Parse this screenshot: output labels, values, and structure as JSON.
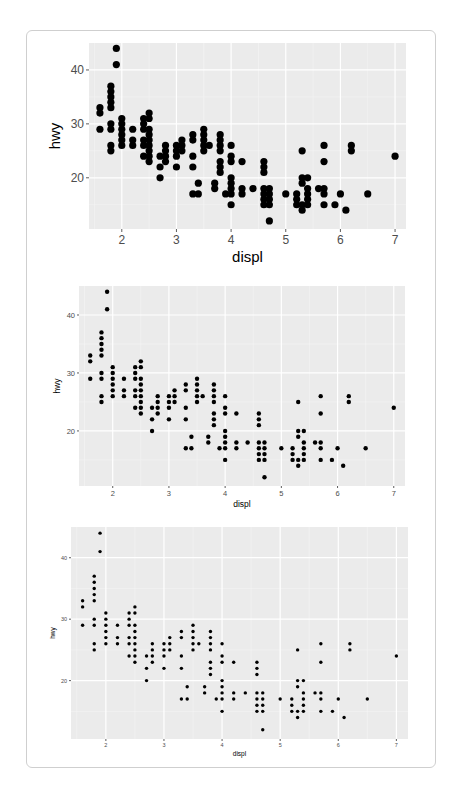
{
  "page": {
    "header_text": "Data Visu"
  },
  "chart_data": [
    {
      "type": "scatter",
      "title": "",
      "xlabel": "displ",
      "ylabel": "hwy",
      "xlim": [
        1.4,
        7.2
      ],
      "ylim": [
        10.5,
        45
      ],
      "xticks": [
        2,
        3,
        4,
        5,
        6,
        7
      ],
      "yticks": [
        20,
        30,
        40
      ],
      "grid": true,
      "panel_bg": "#ebebeb",
      "point_color": "#000000",
      "scale": "large",
      "points": "shared"
    },
    {
      "type": "scatter",
      "xlabel": "displ",
      "ylabel": "hwy",
      "xlim": [
        1.4,
        7.2
      ],
      "ylim": [
        10.5,
        45
      ],
      "xticks": [
        2,
        3,
        4,
        5,
        6,
        7
      ],
      "yticks": [
        20,
        30,
        40
      ],
      "grid": true,
      "scale": "medium",
      "points": "shared"
    },
    {
      "type": "scatter",
      "xlabel": "displ",
      "ylabel": "hwy",
      "xlim": [
        1.4,
        7.2
      ],
      "ylim": [
        10.5,
        45
      ],
      "xticks": [
        2,
        3,
        4,
        5,
        6,
        7
      ],
      "yticks": [
        20,
        30,
        40
      ],
      "grid": true,
      "scale": "small",
      "points": "shared"
    }
  ],
  "shared_points": [
    [
      1.6,
      33
    ],
    [
      1.6,
      32
    ],
    [
      1.6,
      29
    ],
    [
      1.8,
      37
    ],
    [
      1.8,
      36
    ],
    [
      1.8,
      35
    ],
    [
      1.8,
      34
    ],
    [
      1.8,
      33
    ],
    [
      1.8,
      30
    ],
    [
      1.8,
      29
    ],
    [
      1.8,
      26
    ],
    [
      1.8,
      25
    ],
    [
      1.9,
      44
    ],
    [
      1.9,
      41
    ],
    [
      2.0,
      31
    ],
    [
      2.0,
      30
    ],
    [
      2.0,
      29
    ],
    [
      2.0,
      28
    ],
    [
      2.0,
      27
    ],
    [
      2.0,
      26
    ],
    [
      2.2,
      29
    ],
    [
      2.2,
      27
    ],
    [
      2.2,
      26
    ],
    [
      2.4,
      31
    ],
    [
      2.4,
      30
    ],
    [
      2.4,
      29
    ],
    [
      2.4,
      27
    ],
    [
      2.4,
      26
    ],
    [
      2.4,
      24
    ],
    [
      2.5,
      32
    ],
    [
      2.5,
      31
    ],
    [
      2.5,
      29
    ],
    [
      2.5,
      28
    ],
    [
      2.5,
      27
    ],
    [
      2.5,
      26
    ],
    [
      2.5,
      25
    ],
    [
      2.5,
      24
    ],
    [
      2.5,
      23
    ],
    [
      2.7,
      24
    ],
    [
      2.7,
      22
    ],
    [
      2.7,
      20
    ],
    [
      2.8,
      26
    ],
    [
      2.8,
      25
    ],
    [
      2.8,
      24
    ],
    [
      2.8,
      23
    ],
    [
      3.0,
      26
    ],
    [
      3.0,
      25
    ],
    [
      3.0,
      24
    ],
    [
      3.0,
      22
    ],
    [
      3.1,
      27
    ],
    [
      3.1,
      26
    ],
    [
      3.1,
      25
    ],
    [
      3.3,
      28
    ],
    [
      3.3,
      27
    ],
    [
      3.3,
      24
    ],
    [
      3.3,
      22
    ],
    [
      3.3,
      17
    ],
    [
      3.4,
      19
    ],
    [
      3.4,
      17
    ],
    [
      3.5,
      29
    ],
    [
      3.5,
      28
    ],
    [
      3.5,
      27
    ],
    [
      3.5,
      26
    ],
    [
      3.5,
      25
    ],
    [
      3.6,
      26
    ],
    [
      3.7,
      19
    ],
    [
      3.7,
      18
    ],
    [
      3.8,
      28
    ],
    [
      3.8,
      27
    ],
    [
      3.8,
      26
    ],
    [
      3.8,
      25
    ],
    [
      3.8,
      23
    ],
    [
      3.8,
      22
    ],
    [
      3.8,
      21
    ],
    [
      3.9,
      17
    ],
    [
      4.0,
      26
    ],
    [
      4.0,
      24
    ],
    [
      4.0,
      23
    ],
    [
      4.0,
      20
    ],
    [
      4.0,
      19
    ],
    [
      4.0,
      18
    ],
    [
      4.0,
      17
    ],
    [
      4.0,
      15
    ],
    [
      4.2,
      23
    ],
    [
      4.2,
      18
    ],
    [
      4.2,
      17
    ],
    [
      4.4,
      18
    ],
    [
      4.6,
      23
    ],
    [
      4.6,
      22
    ],
    [
      4.6,
      21
    ],
    [
      4.6,
      18
    ],
    [
      4.6,
      17
    ],
    [
      4.6,
      16
    ],
    [
      4.6,
      15
    ],
    [
      4.7,
      18
    ],
    [
      4.7,
      17
    ],
    [
      4.7,
      16
    ],
    [
      4.7,
      15
    ],
    [
      4.7,
      12
    ],
    [
      5.0,
      17
    ],
    [
      5.2,
      17
    ],
    [
      5.2,
      16
    ],
    [
      5.2,
      15
    ],
    [
      5.3,
      25
    ],
    [
      5.3,
      20
    ],
    [
      5.3,
      19
    ],
    [
      5.3,
      15
    ],
    [
      5.3,
      14
    ],
    [
      5.4,
      20
    ],
    [
      5.4,
      18
    ],
    [
      5.4,
      17
    ],
    [
      5.4,
      16
    ],
    [
      5.4,
      15
    ],
    [
      5.6,
      18
    ],
    [
      5.7,
      26
    ],
    [
      5.7,
      23
    ],
    [
      5.7,
      18
    ],
    [
      5.7,
      17
    ],
    [
      5.7,
      15
    ],
    [
      5.9,
      15
    ],
    [
      6.0,
      17
    ],
    [
      6.1,
      14
    ],
    [
      6.2,
      26
    ],
    [
      6.2,
      25
    ],
    [
      6.5,
      17
    ],
    [
      7.0,
      24
    ]
  ]
}
